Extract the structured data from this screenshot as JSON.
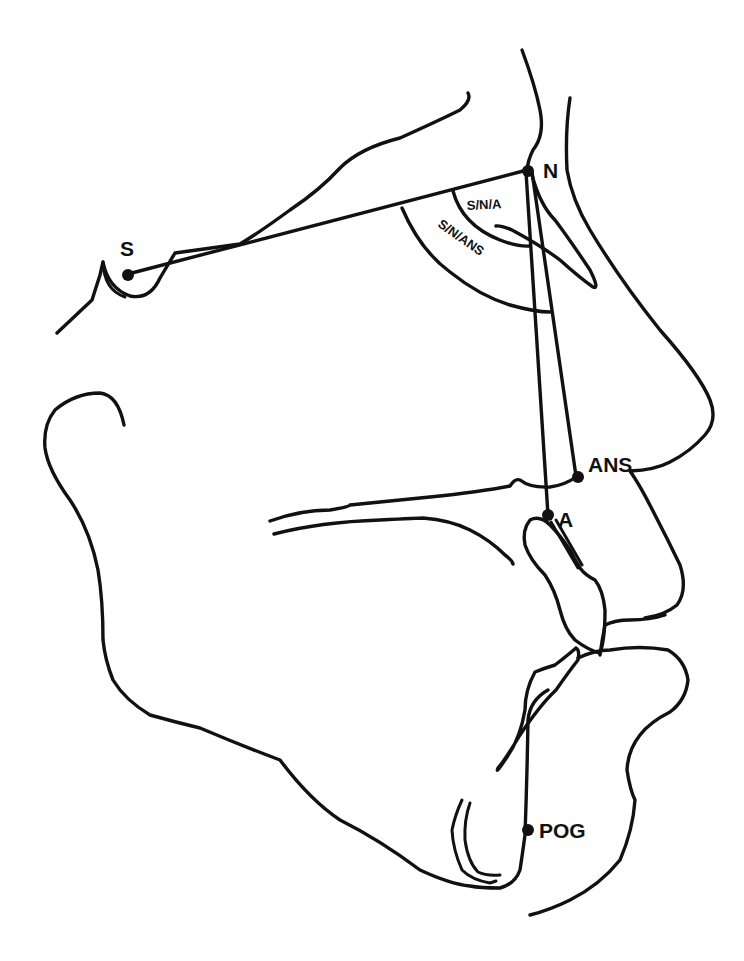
{
  "diagram": {
    "type": "cephalometric-tracing",
    "landmarks": [
      {
        "id": "S",
        "label": "S"
      },
      {
        "id": "N",
        "label": "N"
      },
      {
        "id": "ANS",
        "label": "ANS"
      },
      {
        "id": "A",
        "label": "A"
      },
      {
        "id": "POG",
        "label": "POG"
      }
    ],
    "angles": [
      {
        "id": "S-N-A",
        "label": "S/N/A"
      },
      {
        "id": "S-N-ANS",
        "label": "S/N/ANS"
      }
    ],
    "lines": [
      {
        "from": "S",
        "to": "N"
      },
      {
        "from": "N",
        "to": "A"
      },
      {
        "from": "N",
        "to": "ANS"
      }
    ],
    "colors": {
      "ink": "#111111",
      "background": "#ffffff"
    }
  }
}
